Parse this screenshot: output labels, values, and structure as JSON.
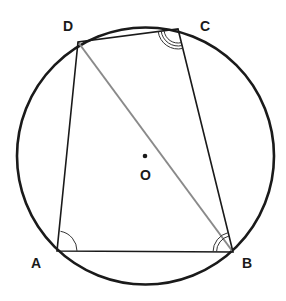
{
  "diagram": {
    "type": "cyclic-quadrilateral",
    "circle": {
      "center": [
        145.5,
        156
      ],
      "radius": 128.5,
      "color": "#1a1a1a"
    },
    "center_label": "O",
    "vertices": [
      {
        "name": "A",
        "x": 57,
        "y": 251,
        "label": "A",
        "lx": 31,
        "ly": 268
      },
      {
        "name": "B",
        "x": 233,
        "y": 252,
        "label": "B",
        "lx": 243,
        "ly": 268
      },
      {
        "name": "C",
        "x": 178,
        "y": 29,
        "label": "C",
        "lx": 200,
        "ly": 31
      },
      {
        "name": "D",
        "x": 78,
        "y": 42,
        "label": "D",
        "lx": 63,
        "ly": 31
      }
    ],
    "sides": [
      "AB",
      "BC",
      "CD",
      "DA"
    ],
    "diagonal": {
      "from": "D",
      "to": "B",
      "color": "#8a8a8a"
    },
    "angle_marks": [
      {
        "vertex": "A",
        "arcs": 1
      },
      {
        "vertex": "B",
        "arcs": 2
      },
      {
        "vertex": "C",
        "arcs": 3
      }
    ]
  }
}
